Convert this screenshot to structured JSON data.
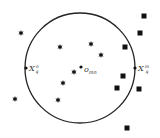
{
  "diagram": {
    "circle": {
      "cx": 80,
      "cy": 68,
      "r": 55,
      "stroke": "#222222"
    },
    "center": {
      "x": 81,
      "y": 67,
      "label_base": "o",
      "label_sub": "mn"
    },
    "left_point": {
      "x": 26,
      "y": 68,
      "label_base": "X",
      "label_sup": "n",
      "label_sub": "q"
    },
    "right_point": {
      "x": 135,
      "y": 68,
      "label_base": "X",
      "label_sup": "m",
      "label_sub": "q"
    },
    "stars": [
      {
        "x": 21,
        "y": 33
      },
      {
        "x": 60,
        "y": 47
      },
      {
        "x": 91,
        "y": 44
      },
      {
        "x": 101,
        "y": 55
      },
      {
        "x": 74,
        "y": 72
      },
      {
        "x": 63,
        "y": 83
      },
      {
        "x": 15,
        "y": 99
      },
      {
        "x": 58,
        "y": 100
      }
    ],
    "squares": [
      {
        "x": 144,
        "y": 16
      },
      {
        "x": 140,
        "y": 33
      },
      {
        "x": 125,
        "y": 47
      },
      {
        "x": 123,
        "y": 76
      },
      {
        "x": 117,
        "y": 88
      },
      {
        "x": 139,
        "y": 89
      },
      {
        "x": 127,
        "y": 128
      }
    ],
    "marker_color": "#111111"
  }
}
